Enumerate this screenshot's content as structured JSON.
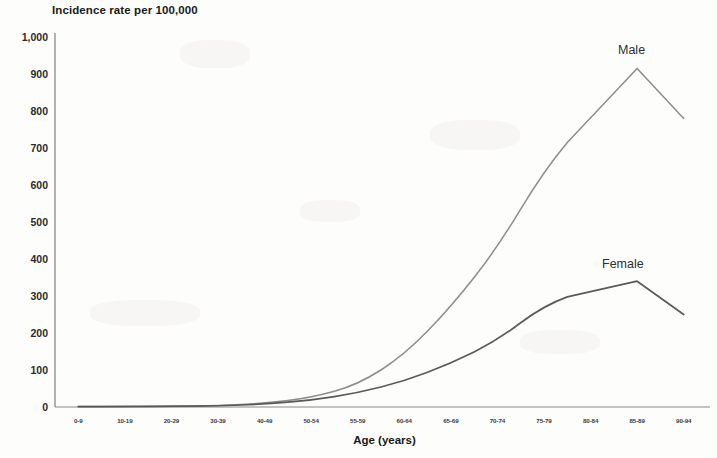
{
  "chart_data": {
    "type": "line",
    "title": "Incidence rate per 100,000",
    "xlabel": "Age (years)",
    "ylabel": "Incidence rate per 100,000",
    "categories": [
      "0-9",
      "10-19",
      "20-29",
      "30-39",
      "40-49",
      "50-54",
      "55-59",
      "60-64",
      "65-69",
      "70-74",
      "75-79",
      "80-84",
      "85-89",
      "90-94"
    ],
    "series": [
      {
        "name": "Male",
        "color": "#8c8c8c",
        "values": [
          1,
          1,
          2,
          4,
          10,
          25,
          60,
          140,
          270,
          430,
          640,
          790,
          915,
          780
        ]
      },
      {
        "name": "Female",
        "color": "#5a5a5a",
        "values": [
          1,
          1,
          2,
          3,
          8,
          18,
          38,
          70,
          118,
          180,
          275,
          320,
          340,
          250
        ]
      }
    ],
    "ylim": [
      0,
      1000
    ],
    "ytick_values": [
      0,
      100,
      200,
      300,
      400,
      500,
      600,
      700,
      800,
      900,
      1000
    ],
    "ytick_labels": [
      "0",
      "100",
      "200",
      "300",
      "400",
      "500",
      "600",
      "700",
      "800",
      "900",
      "1,000"
    ],
    "grid": false,
    "legend_position": "inline-annotation",
    "annotations": [
      {
        "text": "Male",
        "series": "Male"
      },
      {
        "text": "Female",
        "series": "Female"
      }
    ],
    "axis_color": "#8a8a8a"
  }
}
